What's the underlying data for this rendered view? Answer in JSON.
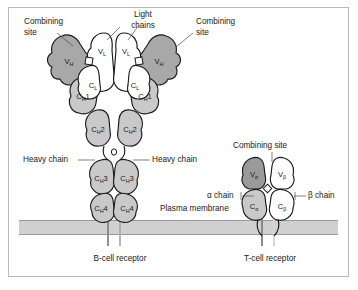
{
  "figure": {
    "title_alt": "B-cell receptor and T-cell receptor structure diagram",
    "background": "#ffffff",
    "frame_color": "#b9b9b9"
  },
  "palette": {
    "heavy_chain_variable": "#a8a8a8",
    "heavy_chain_constant": "#c9c9c9",
    "light_chain": "#ffffff",
    "tcr_alpha_variable": "#9a9a9a",
    "tcr_alpha_constant": "#c9c9c9",
    "tcr_beta": "#ffffff",
    "membrane": "#d0d0d0",
    "membrane_line": "#9a9a9a",
    "outline": "#1a1a1a",
    "leader_line": "#4a4a4a",
    "text": "#1a1a1a"
  },
  "bcell": {
    "caption": "B-cell receptor",
    "callouts": {
      "combining_site_left": "Combining\nsite",
      "combining_site_left_line1": "Combining",
      "combining_site_left_line2": "site",
      "light_chains_line1": "Light",
      "light_chains_line2": "chains",
      "combining_site_right_line1": "Combining",
      "combining_site_right_line2": "site",
      "heavy_chain_left": "Heavy chain",
      "heavy_chain_right": "Heavy chain",
      "plasma_membrane": "Plasma membrane"
    },
    "domains": [
      {
        "id": "vl-left",
        "base": "V",
        "sub": "L",
        "num": ""
      },
      {
        "id": "vl-right",
        "base": "V",
        "sub": "L",
        "num": ""
      },
      {
        "id": "vh-left",
        "base": "V",
        "sub": "H",
        "num": ""
      },
      {
        "id": "vh-right",
        "base": "V",
        "sub": "H",
        "num": ""
      },
      {
        "id": "cl-left",
        "base": "C",
        "sub": "L",
        "num": ""
      },
      {
        "id": "cl-right",
        "base": "C",
        "sub": "L",
        "num": ""
      },
      {
        "id": "ch1-left",
        "base": "C",
        "sub": "H",
        "num": "1"
      },
      {
        "id": "ch1-right",
        "base": "C",
        "sub": "H",
        "num": "1"
      },
      {
        "id": "ch2-left",
        "base": "C",
        "sub": "H",
        "num": "2"
      },
      {
        "id": "ch2-right",
        "base": "C",
        "sub": "H",
        "num": "2"
      },
      {
        "id": "ch3-left",
        "base": "C",
        "sub": "H",
        "num": "3"
      },
      {
        "id": "ch3-right",
        "base": "C",
        "sub": "H",
        "num": "3"
      },
      {
        "id": "ch4-left",
        "base": "C",
        "sub": "H",
        "num": "4"
      },
      {
        "id": "ch4-right",
        "base": "C",
        "sub": "H",
        "num": "4"
      }
    ]
  },
  "tcell": {
    "caption": "T-cell receptor",
    "callouts": {
      "combining_site": "Combining site",
      "alpha_chain": "α chain",
      "beta_chain": "β chain"
    },
    "domains": [
      {
        "id": "v-alpha",
        "base": "V",
        "sub": "α"
      },
      {
        "id": "v-beta",
        "base": "V",
        "sub": "β"
      },
      {
        "id": "c-alpha",
        "base": "C",
        "sub": "α"
      },
      {
        "id": "c-beta",
        "base": "C",
        "sub": "β"
      }
    ]
  }
}
